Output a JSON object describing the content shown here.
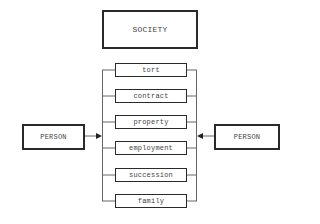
{
  "diagram": {
    "top_node": {
      "label": "SOCIETY"
    },
    "left_node": {
      "label": "PERSON"
    },
    "right_node": {
      "label": "PERSON"
    },
    "categories": [
      {
        "label": "tort"
      },
      {
        "label": "contract"
      },
      {
        "label": "property"
      },
      {
        "label": "employment"
      },
      {
        "label": "succession"
      },
      {
        "label": "family"
      }
    ],
    "edges": [
      {
        "from": "left_node",
        "to": "categories-bracket-left",
        "type": "arrow"
      },
      {
        "from": "right_node",
        "to": "categories-bracket-right",
        "type": "arrow"
      }
    ],
    "colors": {
      "line": "#555555",
      "border": "#2a2a2a",
      "text": "#444444"
    }
  }
}
